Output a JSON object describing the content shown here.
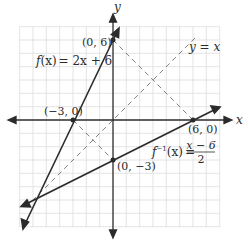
{
  "figure": {
    "axes": {
      "x_label": "x",
      "y_label": "y"
    },
    "grid": {
      "x_min": -7,
      "x_max": 8,
      "y_min": -8,
      "y_max": 7,
      "step": 1
    },
    "lines": {
      "f": {
        "label": "f(x) = 2x + 6",
        "label_prefix": "f",
        "label_arg": "(x)",
        "label_rhs": "= 2x + 6",
        "slope": 2,
        "intercept": 6
      },
      "f_inverse": {
        "label_prefix": "f",
        "label_sup": "−1",
        "label_arg": "(x)",
        "label_eq": "=",
        "numerator": "x − 6",
        "denominator": "2",
        "slope": 0.5,
        "intercept": -3
      },
      "identity": {
        "label": "y = x"
      }
    },
    "points": [
      {
        "label": "(0, 6)",
        "x": 0,
        "y": 6
      },
      {
        "label": "(−3, 0)",
        "x": -3,
        "y": 0
      },
      {
        "label": "(6, 0)",
        "x": 6,
        "y": 0
      },
      {
        "label": "(0, −3)",
        "x": 0,
        "y": -3
      }
    ],
    "colors": {
      "line": "#2b2b2b",
      "grid": "#d9d9d9",
      "dashed": "#777777"
    }
  }
}
